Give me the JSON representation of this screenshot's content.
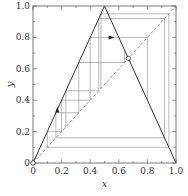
{
  "chart_data": {
    "type": "line",
    "title": "",
    "xlabel": "x",
    "ylabel": "y",
    "xlim": [
      0,
      1.0
    ],
    "ylim": [
      0,
      1.0
    ],
    "xticks": [
      "0",
      "0.2",
      "0.4",
      "0.6",
      "0.8",
      "1.0"
    ],
    "yticks": [
      "0",
      "0.2",
      "0.4",
      "0.6",
      "0.8",
      "1.0"
    ],
    "grid": false,
    "legend": null,
    "series": [
      {
        "name": "tent map",
        "style": "solid",
        "points": [
          [
            0,
            0
          ],
          [
            0.5,
            1.0
          ],
          [
            1.0,
            0
          ]
        ]
      },
      {
        "name": "diagonal y=x",
        "style": "dashed",
        "points": [
          [
            0,
            0
          ],
          [
            1.0,
            1.0
          ]
        ]
      }
    ],
    "cobweb_segments": [
      [
        [
          0.1,
          0.1
        ],
        [
          0.1,
          0.2
        ]
      ],
      [
        [
          0.1,
          0.2
        ],
        [
          0.2,
          0.2
        ]
      ],
      [
        [
          0.2,
          0.2
        ],
        [
          0.2,
          0.4
        ]
      ],
      [
        [
          0.2,
          0.4
        ],
        [
          0.4,
          0.4
        ]
      ],
      [
        [
          0.4,
          0.4
        ],
        [
          0.4,
          0.8
        ]
      ],
      [
        [
          0.4,
          0.8
        ],
        [
          0.8,
          0.8
        ]
      ],
      [
        [
          0.8,
          0.8
        ],
        [
          0.8,
          0.4
        ]
      ],
      [
        [
          0.23,
          0.23
        ],
        [
          0.23,
          0.46
        ]
      ],
      [
        [
          0.23,
          0.46
        ],
        [
          0.46,
          0.46
        ]
      ],
      [
        [
          0.46,
          0.46
        ],
        [
          0.46,
          0.92
        ]
      ],
      [
        [
          0.46,
          0.92
        ],
        [
          0.92,
          0.92
        ]
      ],
      [
        [
          0.92,
          0.92
        ],
        [
          0.92,
          0.16
        ]
      ],
      [
        [
          0.92,
          0.16
        ],
        [
          0.16,
          0.16
        ]
      ],
      [
        [
          0.16,
          0.16
        ],
        [
          0.16,
          0.32
        ]
      ],
      [
        [
          0.16,
          0.32
        ],
        [
          0.32,
          0.32
        ]
      ],
      [
        [
          0.32,
          0.32
        ],
        [
          0.32,
          0.64
        ]
      ],
      [
        [
          0.32,
          0.64
        ],
        [
          0.64,
          0.64
        ]
      ],
      [
        [
          0.64,
          0.64
        ],
        [
          0.64,
          0.72
        ]
      ],
      [
        [
          0.475,
          0.475
        ],
        [
          0.475,
          0.95
        ]
      ],
      [
        [
          0.475,
          0.95
        ],
        [
          0.95,
          0.95
        ]
      ],
      [
        [
          0.95,
          0.95
        ],
        [
          0.95,
          0.1
        ]
      ],
      [
        [
          0.95,
          0.1
        ],
        [
          0.1,
          0.1
        ]
      ]
    ],
    "annotations": [
      {
        "type": "fixed-point-marker",
        "x": 0,
        "y": 0
      },
      {
        "type": "fixed-point-marker",
        "x": 0.6667,
        "y": 0.6667
      },
      {
        "type": "arrow",
        "at": [
          0.17,
          0.34
        ],
        "direction": "up"
      },
      {
        "type": "arrow",
        "at": [
          0.55,
          0.8
        ],
        "direction": "right"
      }
    ]
  },
  "axes": {
    "xlabel": "x",
    "ylabel": "y",
    "xticks": [
      "0",
      "0.2",
      "0.4",
      "0.6",
      "0.8",
      "1.0"
    ],
    "yticks": [
      "0",
      "0.2",
      "0.4",
      "0.6",
      "0.8",
      "1.0"
    ]
  }
}
